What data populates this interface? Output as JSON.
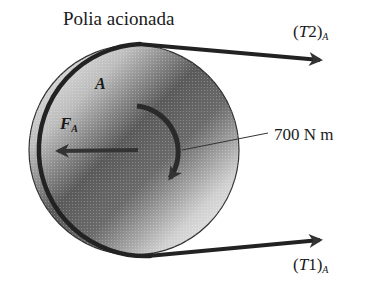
{
  "diagram": {
    "title": "Polia acionada",
    "pulley_label": "A",
    "force": {
      "symbol": "F",
      "subscript": "A"
    },
    "torque_label": "700 N m",
    "tension_top": {
      "open": "(",
      "symbol": "T",
      "index": "2",
      "close": ")",
      "subscript": "A"
    },
    "tension_bottom": {
      "open": "(",
      "symbol": "T",
      "index": "1",
      "close": ")",
      "subscript": "A"
    },
    "colors": {
      "ink": "#1a1a1a",
      "belt": "#222222",
      "pulley_dark": "#4a4a4a",
      "pulley_light": "#f0f0f0",
      "background": "#ffffff"
    },
    "geometry": {
      "pulley_center": [
        134,
        150
      ],
      "pulley_radius": 106
    }
  }
}
